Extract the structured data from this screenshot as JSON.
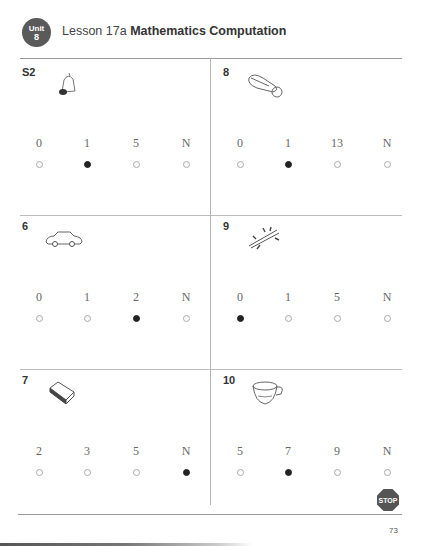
{
  "header": {
    "unit_label": "Unit",
    "unit_number": "8",
    "lesson": "Lesson 17a",
    "subject": "Mathematics Computation"
  },
  "colors": {
    "badge": "#5a5a5a",
    "filled_bubble": "#222222",
    "stop_sign": "#555555"
  },
  "problems": [
    {
      "number": "S2",
      "icon": "bell-icon",
      "options": [
        "0",
        "1",
        "5",
        "N"
      ],
      "selected": 1
    },
    {
      "number": "8",
      "icon": "computer-mouse-icon",
      "options": [
        "0",
        "1",
        "13",
        "N"
      ],
      "selected": 1
    },
    {
      "number": "6",
      "icon": "car-icon",
      "options": [
        "0",
        "1",
        "2",
        "N"
      ],
      "selected": 2
    },
    {
      "number": "9",
      "icon": "broken-stick-icon",
      "options": [
        "0",
        "1",
        "5",
        "N"
      ],
      "selected": 0
    },
    {
      "number": "7",
      "icon": "book-icon",
      "options": [
        "2",
        "3",
        "5",
        "N"
      ],
      "selected": 3
    },
    {
      "number": "10",
      "icon": "cup-icon",
      "options": [
        "5",
        "7",
        "9",
        "N"
      ],
      "selected": 1
    }
  ],
  "footer": {
    "stop_label": "STOP",
    "page_number": "73"
  }
}
